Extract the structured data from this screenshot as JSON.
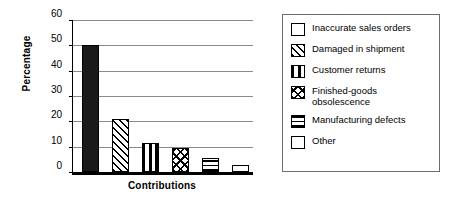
{
  "chart_data": {
    "type": "bar",
    "title": "",
    "xlabel": "Contributions",
    "ylabel": "Percentage",
    "categories": [
      "Inaccurate sales orders",
      "Damaged in shipment",
      "Customer returns",
      "Finished-goods obsolescence",
      "Manufacturing defects",
      "Other"
    ],
    "values": [
      50,
      21,
      11.5,
      9.5,
      5.5,
      2.8
    ],
    "ylim": [
      0,
      60
    ],
    "yticks": [
      "0",
      "10",
      "20",
      "30",
      "40",
      "50",
      "60"
    ],
    "xticks": [],
    "grid": true,
    "legend_position": "right",
    "patterns": [
      "solid",
      "diagonal",
      "vertical",
      "cross",
      "horizontal",
      "empty"
    ]
  },
  "legend": {
    "items": [
      {
        "label": "Inaccurate sales orders",
        "pattern": "solid"
      },
      {
        "label": "Damaged in shipment",
        "pattern": "diagonal"
      },
      {
        "label": "Customer returns",
        "pattern": "vertical"
      },
      {
        "label": "Finished-goods\nobsolescence",
        "pattern": "cross"
      },
      {
        "label": "Manufacturing defects",
        "pattern": "horizontal"
      },
      {
        "label": "Other",
        "pattern": "empty"
      }
    ]
  },
  "colors": {
    "bar_fill": "#1a1a1a",
    "axis": "#000000",
    "gridline": "#8a8a8a",
    "legend_border": "#6d6d6d",
    "background": "#ffffff"
  }
}
